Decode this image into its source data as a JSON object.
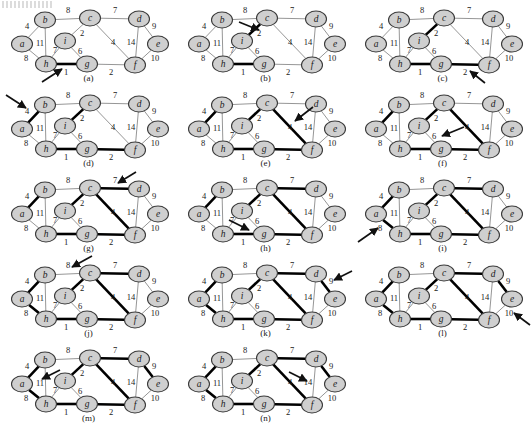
{
  "figure": {
    "panel_count": 14,
    "columns": 3,
    "node_fill": "#cfcfcf",
    "node_stroke": "#3a3a3a",
    "edge_plain_color": "#8a8a8a",
    "edge_tree_color": "#000000",
    "arrow_color": "#111111"
  },
  "graph": {
    "nodes": [
      {
        "id": "a",
        "label": "a",
        "x": 22,
        "y": 44
      },
      {
        "id": "b",
        "label": "b",
        "x": 45,
        "y": 20
      },
      {
        "id": "c",
        "label": "c",
        "x": 90,
        "y": 18
      },
      {
        "id": "d",
        "label": "d",
        "x": 139,
        "y": 19
      },
      {
        "id": "e",
        "label": "e",
        "x": 158,
        "y": 44
      },
      {
        "id": "f",
        "label": "f",
        "x": 135,
        "y": 65
      },
      {
        "id": "g",
        "label": "g",
        "x": 87,
        "y": 64
      },
      {
        "id": "h",
        "label": "h",
        "x": 46,
        "y": 64
      },
      {
        "id": "i",
        "label": "i",
        "x": 65,
        "y": 41
      }
    ],
    "edges": [
      {
        "id": "hg",
        "from": "h",
        "to": "g",
        "weight": 1,
        "lx": 66,
        "ly": 73
      },
      {
        "id": "ic",
        "from": "i",
        "to": "c",
        "weight": 2,
        "lx": 82,
        "ly": 34
      },
      {
        "id": "gf",
        "from": "g",
        "to": "f",
        "weight": 2,
        "lx": 111,
        "ly": 73
      },
      {
        "id": "ab",
        "from": "a",
        "to": "b",
        "weight": 4,
        "lx": 27,
        "ly": 27
      },
      {
        "id": "cf",
        "from": "c",
        "to": "f",
        "weight": 4,
        "lx": 113,
        "ly": 43
      },
      {
        "id": "ig",
        "from": "i",
        "to": "g",
        "weight": 6,
        "lx": 80,
        "ly": 52
      },
      {
        "id": "hi",
        "from": "h",
        "to": "i",
        "weight": 7,
        "lx": 55,
        "ly": 51
      },
      {
        "id": "cd",
        "from": "c",
        "to": "d",
        "weight": 7,
        "lx": 115,
        "ly": 11
      },
      {
        "id": "ah",
        "from": "a",
        "to": "h",
        "weight": 8,
        "lx": 26,
        "ly": 59
      },
      {
        "id": "bc",
        "from": "b",
        "to": "c",
        "weight": 8,
        "lx": 68,
        "ly": 11
      },
      {
        "id": "de",
        "from": "d",
        "to": "e",
        "weight": 9,
        "lx": 154,
        "ly": 27
      },
      {
        "id": "ef",
        "from": "e",
        "to": "f",
        "weight": 10,
        "lx": 155,
        "ly": 59
      },
      {
        "id": "bh",
        "from": "b",
        "to": "h",
        "weight": 11,
        "lx": 40,
        "ly": 44
      },
      {
        "id": "df",
        "from": "d",
        "to": "f",
        "weight": 14,
        "lx": 131,
        "ly": 43
      }
    ]
  },
  "panels": [
    {
      "id": "a",
      "caption": "(a)",
      "col": 0,
      "row": 0,
      "tree_edges": [
        "hg"
      ],
      "arrow": {
        "target_edge": "hg",
        "from_x": 42,
        "from_y": 82,
        "to_x": 62,
        "to_y": 69
      }
    },
    {
      "id": "b",
      "caption": "(b)",
      "col": 1,
      "row": 0,
      "tree_edges": [
        "hg",
        "ic"
      ],
      "arrow": {
        "target_edge": "ic",
        "from_x": 62,
        "from_y": 22,
        "to_x": 82,
        "to_y": 30
      }
    },
    {
      "id": "c",
      "caption": "(c)",
      "col": 2,
      "row": 0,
      "tree_edges": [
        "hg",
        "ic",
        "gf"
      ],
      "arrow": {
        "target_edge": "gf",
        "from_x": 131,
        "from_y": 83,
        "to_x": 116,
        "to_y": 71
      }
    },
    {
      "id": "d",
      "caption": "(d)",
      "col": 0,
      "row": 1,
      "tree_edges": [
        "hg",
        "ic",
        "gf",
        "ab"
      ],
      "arrow": {
        "target_edge": "ab",
        "from_x": 6,
        "from_y": 10,
        "to_x": 26,
        "to_y": 23
      }
    },
    {
      "id": "e",
      "caption": "(e)",
      "col": 1,
      "row": 1,
      "tree_edges": [
        "hg",
        "ic",
        "gf",
        "ab",
        "cf"
      ],
      "arrow": {
        "target_edge": "cf",
        "from_x": 136,
        "from_y": 22,
        "to_x": 118,
        "to_y": 36
      }
    },
    {
      "id": "f",
      "caption": "(f)",
      "col": 2,
      "row": 1,
      "tree_edges": [
        "hg",
        "ic",
        "gf",
        "ab",
        "cf"
      ],
      "arrow": {
        "target_edge": "ig",
        "from_x": 110,
        "from_y": 42,
        "to_x": 88,
        "to_y": 51
      }
    },
    {
      "id": "g",
      "caption": "(g)",
      "col": 0,
      "row": 2,
      "tree_edges": [
        "hg",
        "ic",
        "gf",
        "ab",
        "cf",
        "cd"
      ],
      "arrow": {
        "target_edge": "cd",
        "from_x": 136,
        "from_y": 2,
        "to_x": 118,
        "to_y": 13
      }
    },
    {
      "id": "h",
      "caption": "(h)",
      "col": 1,
      "row": 2,
      "tree_edges": [
        "hg",
        "ic",
        "gf",
        "ab",
        "cf",
        "cd"
      ],
      "arrow": {
        "target_edge": "hi",
        "from_x": 52,
        "from_y": 50,
        "to_x": 72,
        "to_y": 60
      }
    },
    {
      "id": "i",
      "caption": "(i)",
      "col": 2,
      "row": 2,
      "tree_edges": [
        "hg",
        "ic",
        "gf",
        "ab",
        "cf",
        "cd",
        "ah"
      ],
      "arrow": {
        "target_edge": "ah",
        "from_x": 4,
        "from_y": 72,
        "to_x": 24,
        "to_y": 58
      }
    },
    {
      "id": "j",
      "caption": "(j)",
      "col": 0,
      "row": 3,
      "tree_edges": [
        "hg",
        "ic",
        "gf",
        "ab",
        "cf",
        "cd",
        "ah"
      ],
      "arrow": {
        "target_edge": "bc",
        "from_x": 92,
        "from_y": 1,
        "to_x": 72,
        "to_y": 12
      }
    },
    {
      "id": "k",
      "caption": "(k)",
      "col": 1,
      "row": 3,
      "tree_edges": [
        "hg",
        "ic",
        "gf",
        "ab",
        "cf",
        "cd",
        "ah",
        "de"
      ],
      "arrow": {
        "target_edge": "de",
        "from_x": 175,
        "from_y": 16,
        "to_x": 157,
        "to_y": 25
      }
    },
    {
      "id": "l",
      "caption": "(l)",
      "col": 2,
      "row": 3,
      "tree_edges": [
        "hg",
        "ic",
        "gf",
        "ab",
        "cf",
        "cd",
        "ah",
        "de"
      ],
      "arrow": {
        "target_edge": "ef",
        "from_x": 176,
        "from_y": 70,
        "to_x": 160,
        "to_y": 58
      }
    },
    {
      "id": "m",
      "caption": "(m)",
      "col": 0,
      "row": 4,
      "tree_edges": [
        "hg",
        "ic",
        "gf",
        "ab",
        "cf",
        "cd",
        "ah",
        "de"
      ],
      "arrow": {
        "target_edge": "bh",
        "from_x": 60,
        "from_y": 30,
        "to_x": 42,
        "to_y": 39
      }
    },
    {
      "id": "n",
      "caption": "(n)",
      "col": 1,
      "row": 4,
      "tree_edges": [
        "hg",
        "ic",
        "gf",
        "ab",
        "cf",
        "cd",
        "ah",
        "de"
      ],
      "arrow": {
        "target_edge": "df",
        "from_x": 112,
        "from_y": 32,
        "to_x": 130,
        "to_y": 41
      }
    }
  ]
}
